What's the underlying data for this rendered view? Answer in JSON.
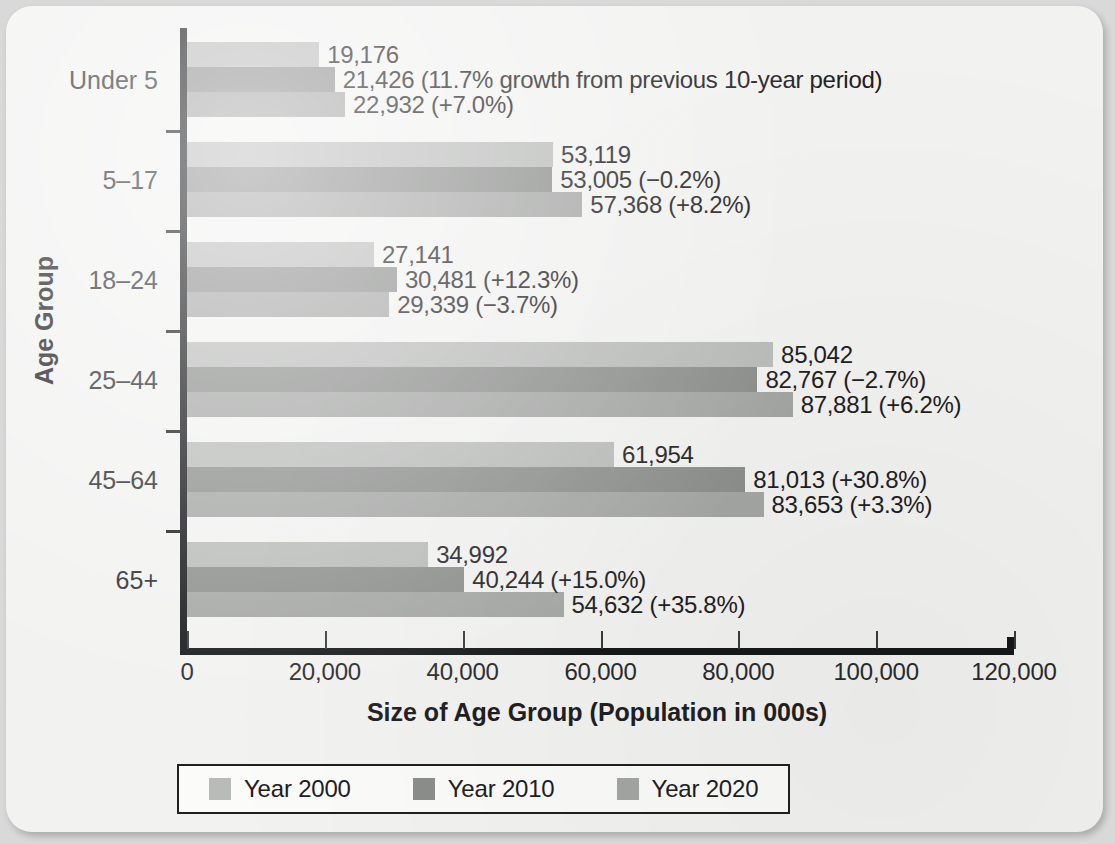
{
  "chart_data": {
    "type": "bar",
    "orientation": "horizontal",
    "title": "",
    "xlabel": "Size of Age Group (Population in 000s)",
    "ylabel": "Age Group",
    "xlim": [
      0,
      120000
    ],
    "xticks": [
      0,
      20000,
      40000,
      60000,
      80000,
      100000,
      120000
    ],
    "xtick_labels": [
      "0",
      "20,000",
      "40,000",
      "60,000",
      "80,000",
      "100,000",
      "120,000"
    ],
    "grid": false,
    "legend_position": "bottom",
    "categories": [
      "Under 5",
      "5–17",
      "18–24",
      "25–44",
      "45–64",
      "65+"
    ],
    "series": [
      {
        "name": "Year 2000",
        "color": "#b9bbb9",
        "values": [
          19176,
          53119,
          27141,
          85042,
          61954,
          34992
        ],
        "labels": [
          "19,176",
          "53,119",
          "27,141",
          "85,042",
          "61,954",
          "34,992"
        ]
      },
      {
        "name": "Year 2010",
        "color": "#8c8e8c",
        "values": [
          21426,
          53005,
          30481,
          82767,
          81013,
          40244
        ],
        "labels": [
          "21,426 (11.7% growth from previous 10-year period)",
          "53,005 (−0.2%)",
          "30,481 (+12.3%)",
          "82,767 (−2.7%)",
          "81,013 (+30.8%)",
          "40,244 (+15.0%)"
        ]
      },
      {
        "name": "Year 2020",
        "color": "#a4a6a4",
        "values": [
          22932,
          57368,
          29339,
          87881,
          83653,
          54632
        ],
        "labels": [
          "22,932 (+7.0%)",
          "57,368 (+8.2%)",
          "29,339 (−3.7%)",
          "87,881 (+6.2%)",
          "83,653 (+3.3%)",
          "54,632 (+35.8%)"
        ]
      }
    ]
  },
  "legend": {
    "items": [
      {
        "label": "Year 2000",
        "color": "#b9bbb9"
      },
      {
        "label": "Year 2010",
        "color": "#8c8e8c"
      },
      {
        "label": "Year 2020",
        "color": "#a4a6a4"
      }
    ]
  }
}
